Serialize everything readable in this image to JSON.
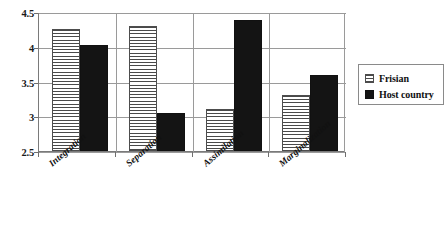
{
  "chart_data": {
    "type": "bar",
    "title": "",
    "subtitle": "",
    "xlabel": "",
    "ylabel": "",
    "categories": [
      "Integration",
      "Separation",
      "Assimilation",
      "Marginalization"
    ],
    "series": [
      {
        "name": "Frisian",
        "values": [
          4.25,
          4.3,
          3.1,
          3.3
        ],
        "style": "horizontal-stripes",
        "color": "#ffffff"
      },
      {
        "name": "Host country",
        "values": [
          4.02,
          3.05,
          4.38,
          3.6
        ],
        "style": "solid",
        "color": "#141414"
      }
    ],
    "ylim": [
      2.5,
      4.5
    ],
    "yticks": [
      "2.5",
      "3",
      "3.5",
      "4",
      "4.5"
    ],
    "ytick_values": [
      2.5,
      3,
      3.5,
      4,
      4.5
    ],
    "grid": true,
    "grid_axis": "y",
    "legend": {
      "position": "right",
      "boxed": true
    },
    "xtick_label_rotation": -41
  },
  "legend": {
    "entries": [
      {
        "label": "Frisian",
        "swatch": "striped-swatch-icon"
      },
      {
        "label": "Host country",
        "swatch": "solid-black-swatch-icon"
      }
    ]
  }
}
